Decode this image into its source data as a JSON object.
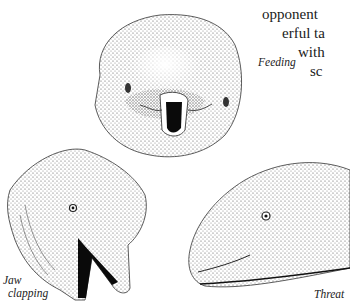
{
  "page": {
    "body_text_lines": [
      "opponent",
      "erful ta",
      "with",
      "sc"
    ]
  },
  "illustration": {
    "subject": "beluga whale head illustrations",
    "captions": {
      "feeding": "Feeding",
      "jaw_clapping_line1": "Jaw",
      "jaw_clapping_line2": "clapping",
      "threat": "Threat"
    }
  }
}
